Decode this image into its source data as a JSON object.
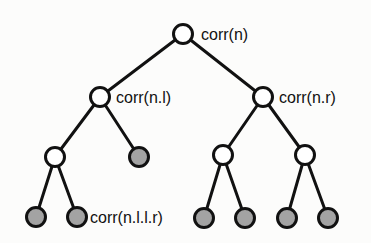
{
  "figure": {
    "name": "binary-tree-correlation-diagram",
    "background_color": "#fcfcfb",
    "edge_color": "#111111",
    "edge_width": 3,
    "node_radius": 9.5,
    "node_stroke_color": "#111111",
    "node_stroke_width": 3,
    "open_node_fill": "#ffffff",
    "shaded_node_fill": "#a3a3a3",
    "label_color": "#111111",
    "label_font_size": 16
  },
  "tree": {
    "nodes": [
      {
        "id": "n",
        "x": 183,
        "y": 34,
        "shaded": false,
        "label": "corr(n)",
        "label_x": 201,
        "label_y": 40
      },
      {
        "id": "n.l",
        "x": 100,
        "y": 97,
        "shaded": false,
        "label": "corr(n.l)",
        "label_x": 116,
        "label_y": 103
      },
      {
        "id": "n.r",
        "x": 263,
        "y": 97,
        "shaded": false,
        "label": "corr(n.r)",
        "label_x": 279,
        "label_y": 103
      },
      {
        "id": "n.l.l",
        "x": 55,
        "y": 157,
        "shaded": false,
        "label": "",
        "label_x": 0,
        "label_y": 0
      },
      {
        "id": "n.l.r",
        "x": 139,
        "y": 157,
        "shaded": true,
        "label": "",
        "label_x": 0,
        "label_y": 0
      },
      {
        "id": "n.r.l",
        "x": 223,
        "y": 155,
        "shaded": false,
        "label": "",
        "label_x": 0,
        "label_y": 0
      },
      {
        "id": "n.r.r",
        "x": 305,
        "y": 155,
        "shaded": false,
        "label": "",
        "label_x": 0,
        "label_y": 0
      },
      {
        "id": "n.l.l.l",
        "x": 36,
        "y": 217,
        "shaded": true,
        "label": "",
        "label_x": 0,
        "label_y": 0
      },
      {
        "id": "n.l.l.r",
        "x": 77,
        "y": 217,
        "shaded": true,
        "label": "corr(n.l.l.r)",
        "label_x": 90,
        "label_y": 223
      },
      {
        "id": "n.r.l.l",
        "x": 204,
        "y": 218,
        "shaded": true,
        "label": "",
        "label_x": 0,
        "label_y": 0
      },
      {
        "id": "n.r.l.r",
        "x": 245,
        "y": 218,
        "shaded": true,
        "label": "",
        "label_x": 0,
        "label_y": 0
      },
      {
        "id": "n.r.r.l",
        "x": 287,
        "y": 218,
        "shaded": true,
        "label": "",
        "label_x": 0,
        "label_y": 0
      },
      {
        "id": "n.r.r.r",
        "x": 328,
        "y": 218,
        "shaded": true,
        "label": "",
        "label_x": 0,
        "label_y": 0
      }
    ],
    "edges": [
      {
        "from": "n",
        "to": "n.l"
      },
      {
        "from": "n",
        "to": "n.r"
      },
      {
        "from": "n.l",
        "to": "n.l.l"
      },
      {
        "from": "n.l",
        "to": "n.l.r"
      },
      {
        "from": "n.r",
        "to": "n.r.l"
      },
      {
        "from": "n.r",
        "to": "n.r.r"
      },
      {
        "from": "n.l.l",
        "to": "n.l.l.l"
      },
      {
        "from": "n.l.l",
        "to": "n.l.l.r"
      },
      {
        "from": "n.r.l",
        "to": "n.r.l.l"
      },
      {
        "from": "n.r.l",
        "to": "n.r.l.r"
      },
      {
        "from": "n.r.r",
        "to": "n.r.r.l"
      },
      {
        "from": "n.r.r",
        "to": "n.r.r.r"
      }
    ]
  }
}
